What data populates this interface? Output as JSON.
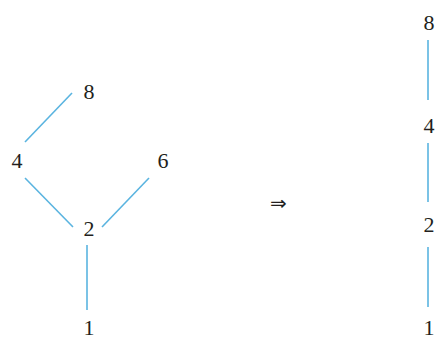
{
  "diagram": {
    "left_poset": {
      "nodes": [
        {
          "id": "n8",
          "label": "8",
          "x": 89,
          "y": 99
        },
        {
          "id": "n4",
          "label": "4",
          "x": 17,
          "y": 168
        },
        {
          "id": "n6",
          "label": "6",
          "x": 163,
          "y": 168
        },
        {
          "id": "n2",
          "label": "2",
          "x": 89,
          "y": 236
        },
        {
          "id": "n1",
          "label": "1",
          "x": 89,
          "y": 335
        }
      ],
      "edges": [
        {
          "from": "n4",
          "to": "n8",
          "x1": 25,
          "y1": 142,
          "x2": 72,
          "y2": 93
        },
        {
          "from": "n2",
          "to": "n4",
          "x1": 25,
          "y1": 178,
          "x2": 73,
          "y2": 227
        },
        {
          "from": "n2",
          "to": "n6",
          "x1": 102,
          "y1": 227,
          "x2": 149,
          "y2": 178
        },
        {
          "from": "n1",
          "to": "n2",
          "x1": 87,
          "y1": 245,
          "x2": 87,
          "y2": 310
        }
      ]
    },
    "arrow": {
      "symbol": "⇒",
      "x": 270,
      "y": 210
    },
    "right_chain": {
      "nodes": [
        {
          "id": "r8",
          "label": "8",
          "x": 429,
          "y": 30
        },
        {
          "id": "r4",
          "label": "4",
          "x": 429,
          "y": 133
        },
        {
          "id": "r2",
          "label": "2",
          "x": 429,
          "y": 232
        },
        {
          "id": "r1",
          "label": "1",
          "x": 429,
          "y": 335
        }
      ],
      "edges": [
        {
          "from": "r4",
          "to": "r8",
          "x1": 428,
          "y1": 40,
          "x2": 428,
          "y2": 100
        },
        {
          "from": "r2",
          "to": "r4",
          "x1": 428,
          "y1": 143,
          "x2": 428,
          "y2": 202
        },
        {
          "from": "r1",
          "to": "r2",
          "x1": 428,
          "y1": 247,
          "x2": 428,
          "y2": 307
        }
      ]
    },
    "colors": {
      "edge": "#5ab4e0",
      "text": "#231f20",
      "background": "#ffffff"
    }
  }
}
